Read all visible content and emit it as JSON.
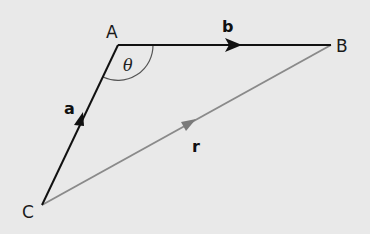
{
  "diagram": {
    "background": "#e9e9e9",
    "points": {
      "A": {
        "label": "A",
        "x": 118,
        "y": 45
      },
      "B": {
        "label": "B",
        "x": 331,
        "y": 45
      },
      "C": {
        "label": "C",
        "x": 42,
        "y": 205
      }
    },
    "vectors": [
      {
        "name": "a",
        "label": "a",
        "from": "C",
        "to": "A",
        "color": "#111111"
      },
      {
        "name": "b",
        "label": "b",
        "from": "A",
        "to": "B",
        "color": "#111111"
      },
      {
        "name": "r",
        "label": "r",
        "from": "C",
        "to": "B",
        "color": "#8a8a8a"
      }
    ],
    "angle": {
      "label": "θ",
      "at": "A"
    }
  }
}
